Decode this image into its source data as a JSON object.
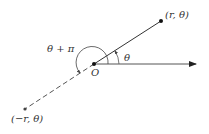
{
  "diagram": {
    "origin_label": "O",
    "point_label": "(r, θ)",
    "negative_point_label": "(−r, θ)",
    "angle_label": "θ",
    "angle_plus_pi_label": "θ + π",
    "colors": {
      "line": "#333333",
      "dashed": "#555555",
      "arc": "#444444"
    }
  }
}
